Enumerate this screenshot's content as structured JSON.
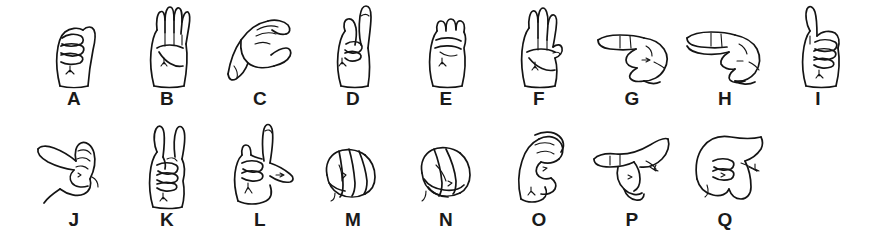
{
  "chart": {
    "background_color": "#ffffff",
    "ink_color": "#141414",
    "rows": [
      {
        "row_name": "row-1",
        "signs": [
          {
            "letter": "A",
            "icon": "asl-hand-a-icon",
            "description": "closed fist, thumb alongside, palm facing out"
          },
          {
            "letter": "B",
            "icon": "asl-hand-b-icon",
            "description": "flat hand, four fingers up together, thumb folded across palm"
          },
          {
            "letter": "C",
            "icon": "asl-hand-c-icon",
            "description": "hand curved into the shape of the letter C, viewed from the side"
          },
          {
            "letter": "D",
            "icon": "asl-hand-d-icon",
            "description": "index finger pointing up, other fingers meeting thumb"
          },
          {
            "letter": "E",
            "icon": "asl-hand-e-icon",
            "description": "fingers curled down onto thumb, fist-like"
          },
          {
            "letter": "F",
            "icon": "asl-hand-f-icon",
            "description": "index and thumb touching in a circle, three fingers up"
          },
          {
            "letter": "G",
            "icon": "asl-hand-g-icon",
            "description": "index finger pointing sideways, thumb extended parallel"
          },
          {
            "letter": "H",
            "icon": "asl-hand-h-icon",
            "description": "index and middle finger extended sideways together"
          },
          {
            "letter": "I",
            "icon": "asl-hand-i-icon",
            "description": "pinky finger extended up from a closed fist"
          }
        ]
      },
      {
        "row_name": "row-2",
        "signs": [
          {
            "letter": "J",
            "icon": "asl-hand-j-icon",
            "description": "pinky extended and traced in a J motion"
          },
          {
            "letter": "K",
            "icon": "asl-hand-k-icon",
            "description": "index and middle fingers up in a V, thumb between them"
          },
          {
            "letter": "L",
            "icon": "asl-hand-l-icon",
            "description": "index finger up and thumb out forming an L"
          },
          {
            "letter": "M",
            "icon": "asl-hand-m-icon",
            "description": "thumb tucked under three fingers"
          },
          {
            "letter": "N",
            "icon": "asl-hand-n-icon",
            "description": "thumb tucked under two fingers"
          },
          {
            "letter": "O",
            "icon": "asl-hand-o-icon",
            "description": "fingers and thumb curved to form a round O"
          },
          {
            "letter": "P",
            "icon": "asl-hand-p-icon",
            "description": "K handshape pointed downward"
          },
          {
            "letter": "Q",
            "icon": "asl-hand-q-icon",
            "description": "G handshape pointed downward"
          }
        ]
      }
    ]
  }
}
